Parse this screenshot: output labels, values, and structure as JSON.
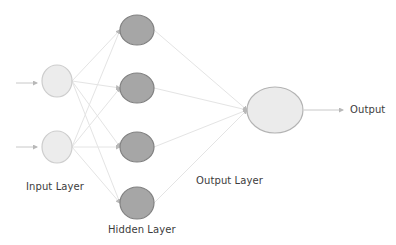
{
  "diagram": {
    "type": "neural-network",
    "labels": {
      "input_layer": "Input Layer",
      "hidden_layer": "Hidden Layer",
      "output_layer": "Output Layer",
      "output": "Output"
    },
    "colors": {
      "input_fill": "#ececec",
      "input_stroke": "#cdcdcd",
      "hidden_fill": "#a6a6a6",
      "hidden_stroke": "#808080",
      "output_fill": "#ebebeb",
      "output_stroke": "#b3b3b3",
      "edge": "#e4e4e4",
      "arrow": "#c8c8c8"
    },
    "layers": {
      "input": [
        {
          "id": "i1",
          "cx": 57,
          "cy": 81,
          "rx": 15,
          "ry": 16
        },
        {
          "id": "i2",
          "cx": 57,
          "cy": 147,
          "rx": 15,
          "ry": 16
        }
      ],
      "hidden": [
        {
          "id": "h1",
          "cx": 137,
          "cy": 30,
          "rx": 17,
          "ry": 15
        },
        {
          "id": "h2",
          "cx": 137,
          "cy": 88,
          "rx": 17,
          "ry": 15
        },
        {
          "id": "h3",
          "cx": 137,
          "cy": 147,
          "rx": 17,
          "ry": 15
        },
        {
          "id": "h4",
          "cx": 137,
          "cy": 203,
          "rx": 17,
          "ry": 16
        }
      ],
      "output": [
        {
          "id": "o1",
          "cx": 275,
          "cy": 110,
          "rx": 28,
          "ry": 23
        }
      ]
    },
    "input_arrows": [
      {
        "x1": 16,
        "y1": 83,
        "x2": 37,
        "y2": 83
      },
      {
        "x1": 16,
        "y1": 147,
        "x2": 37,
        "y2": 147
      }
    ],
    "output_arrow": {
      "x1": 304,
      "y1": 110,
      "x2": 343,
      "y2": 110
    }
  }
}
